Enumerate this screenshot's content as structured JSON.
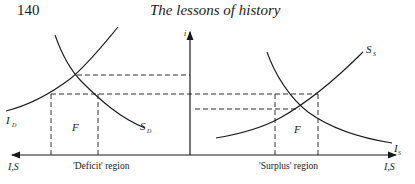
{
  "page": {
    "number": "140",
    "running_title": "The lessons of history"
  },
  "diagram": {
    "vertical_axis_label": "i",
    "horizontal_axis_label_left": "I,S",
    "horizontal_axis_label_right": "I,S",
    "left_panel": {
      "region_label": "'Deficit' region",
      "investment_curve": {
        "label_main": "I",
        "label_sub": "D"
      },
      "saving_curve": {
        "label_main": "S",
        "label_sub": "D"
      },
      "gap_label": "F"
    },
    "right_panel": {
      "region_label": "'Surplus' region",
      "investment_curve": {
        "label_main": "I",
        "label_sub": "S"
      },
      "saving_curve": {
        "label_main": "S",
        "label_sub": "S"
      },
      "gap_label": "F"
    }
  }
}
